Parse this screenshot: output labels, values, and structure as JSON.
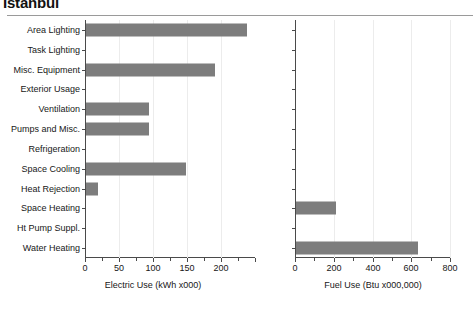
{
  "title": "Istanbul",
  "chart_data": [
    {
      "type": "bar",
      "orientation": "horizontal",
      "title": "Istanbul",
      "panel": "left",
      "xlabel": "Electric Use (kWh x000)",
      "ylabel": "",
      "xlim": [
        0,
        250
      ],
      "xticks": [
        0,
        50,
        100,
        150,
        200
      ],
      "xtick_labels": [
        "0",
        "50",
        "100",
        "150",
        "200"
      ],
      "grid": true,
      "legend": "none",
      "bar_color": "#7d7d7d",
      "categories": [
        "Area Lighting",
        "Task Lighting",
        "Misc. Equipment",
        "Exterior Usage",
        "Ventilation",
        "Pumps and Misc.",
        "Refrigeration",
        "Space Cooling",
        "Heat Rejection",
        "Space Heating",
        "Ht Pump Suppl.",
        "Water Heating"
      ],
      "values": [
        237,
        0,
        190,
        0,
        93,
        93,
        0,
        147,
        17,
        0,
        0,
        0
      ]
    },
    {
      "type": "bar",
      "orientation": "horizontal",
      "panel": "right",
      "xlabel": "Fuel Use (Btu x000,000)",
      "ylabel": "",
      "xlim": [
        0,
        800
      ],
      "xticks": [
        0,
        200,
        400,
        600,
        800
      ],
      "xtick_labels": [
        "0",
        "200",
        "400",
        "600",
        "800"
      ],
      "grid": true,
      "legend": "none",
      "bar_color": "#7d7d7d",
      "categories": [
        "Area Lighting",
        "Task Lighting",
        "Misc. Equipment",
        "Exterior Usage",
        "Ventilation",
        "Pumps and Misc.",
        "Refrigeration",
        "Space Cooling",
        "Heat Rejection",
        "Space Heating",
        "Ht Pump Suppl.",
        "Water Heating"
      ],
      "values": [
        0,
        0,
        0,
        0,
        0,
        0,
        0,
        0,
        0,
        205,
        0,
        630
      ]
    }
  ]
}
